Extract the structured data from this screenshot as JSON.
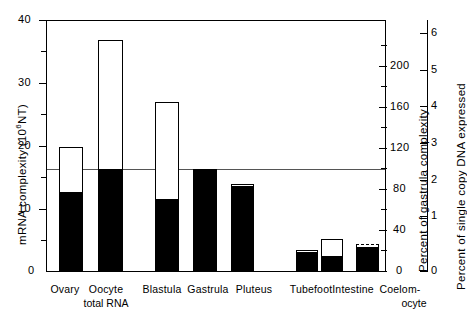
{
  "chart_data": {
    "type": "bar",
    "title": "",
    "xlabel": "",
    "ylabel": "mRNA complexity (10⁶ NT)",
    "categories": [
      "Ovary",
      "Oocyte total RNA",
      "Blastula",
      "Gastrula",
      "Pluteus",
      "Tubefoot",
      "Intestine",
      "Coelomocyte"
    ],
    "series": [
      {
        "name": "total mRNA complexity (outline)",
        "values": [
          19.8,
          37.0,
          27.0,
          16.4,
          13.9,
          3.4,
          5.1,
          4.3
        ]
      },
      {
        "name": "complexity shared with gastrula (filled)",
        "values": [
          12.7,
          16.4,
          11.6,
          16.4,
          13.6,
          3.0,
          2.4,
          3.9
        ]
      }
    ],
    "outline_styles": [
      "solid",
      "solid",
      "solid",
      "solid",
      "solid",
      "solid",
      "solid",
      "dashed"
    ],
    "reference_line": {
      "value": 16.4,
      "label": "gastrula complexity"
    },
    "ylim": [
      0,
      40
    ],
    "yticks": [
      0,
      10,
      20,
      30,
      40
    ],
    "yticklabels": [
      "0",
      "10",
      "20",
      "30",
      "40"
    ],
    "yminorticks": [
      5,
      15,
      25,
      35
    ],
    "grid": false,
    "right_axis_1": {
      "label": "Percent of gastrula complexity",
      "ticks": [
        0,
        40,
        80,
        120,
        160,
        200
      ],
      "ticklabels": [
        "0",
        "40",
        "80",
        "120",
        "160",
        "200"
      ],
      "minorticks": [
        20,
        60,
        100,
        140,
        180,
        220
      ],
      "lim": [
        0,
        243
      ]
    },
    "right_axis_2": {
      "label": "Percent of single copy DNA expressed",
      "ticks": [
        0,
        1,
        2,
        3,
        4,
        5,
        6
      ],
      "ticklabels": [
        "0",
        "1",
        "2",
        "3",
        "4",
        "5",
        "6"
      ],
      "lim": [
        0,
        6.9
      ]
    },
    "legend": []
  },
  "axes": {
    "left": {
      "title_part1": "mRNA complexity (10",
      "title_exp": "6",
      "title_part2": "NT)"
    },
    "right1": {
      "title": "Percent of gastrula complexity"
    },
    "right2": {
      "title": "Percent of single copy DNA expressed"
    }
  },
  "xlabels": [
    {
      "line1": "Ovary",
      "line2": ""
    },
    {
      "line1": "Oocyte",
      "line2": "total RNA"
    },
    {
      "line1": "Blastula",
      "line2": ""
    },
    {
      "line1": "Gastrula",
      "line2": ""
    },
    {
      "line1": "Pluteus",
      "line2": ""
    },
    {
      "line1": "Tubefoot",
      "line2": ""
    },
    {
      "line1": "Intestine",
      "line2": ""
    },
    {
      "line1": "Coelom-",
      "line2": "ocyte"
    }
  ],
  "colors": {
    "ink": "#000000",
    "fill": "#000000",
    "outline": "#000000",
    "reference": "#555555"
  }
}
